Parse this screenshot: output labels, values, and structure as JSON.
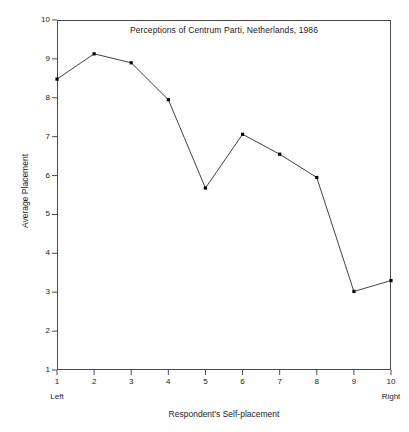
{
  "chart_data": {
    "type": "line",
    "title": "Perceptions of Centrum Parti, Netherlands, 1986",
    "xlabel": "Respondent's Self-placement",
    "ylabel": "Average Placement",
    "x": [
      1,
      2,
      3,
      4,
      5,
      6,
      7,
      8,
      9,
      10
    ],
    "values": [
      8.48,
      9.13,
      8.9,
      7.95,
      5.68,
      7.06,
      6.55,
      5.95,
      3.02,
      3.3
    ],
    "xticklabels": [
      "1",
      "2",
      "3",
      "4",
      "5",
      "6",
      "7",
      "8",
      "9",
      "10"
    ],
    "yticklabels": [
      "1",
      "2",
      "3",
      "4",
      "5",
      "6",
      "7",
      "8",
      "9",
      "10"
    ],
    "ylim": [
      1,
      10
    ],
    "xlim": [
      1,
      10
    ],
    "grid": false,
    "legend": false,
    "x_end_labels": {
      "left": "Left",
      "right": "Right"
    },
    "marker": "filled-square",
    "line_color": "#2b2b2b",
    "marker_color": "#000000",
    "axis_color": "#4a4a4a",
    "background": "#ffffff"
  }
}
